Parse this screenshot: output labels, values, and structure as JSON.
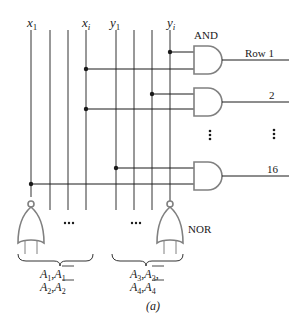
{
  "diagram": {
    "caption": "(a)",
    "column_labels": {
      "x1": "x",
      "x1_sub": "1",
      "xi": "x",
      "xi_sub": "i",
      "y1": "y",
      "y1_sub": "1",
      "yi": "y",
      "yi_sub": "i"
    },
    "gate_labels": {
      "and": "AND",
      "nor": "NOR"
    },
    "rows": [
      {
        "label": "Row 1"
      },
      {
        "label": "2"
      },
      {
        "label": "⋮"
      },
      {
        "label": "16"
      }
    ],
    "ellipsis_h": "•••",
    "ellipsis_v": "⋮",
    "left_group": {
      "line1_a": "A",
      "line1_a_sub": "1",
      "line1_sep": ",",
      "line1_b": "A",
      "line1_b_sub": "1",
      "line2_a": "A",
      "line2_a_sub": "2",
      "line2_sep": ",",
      "line2_b": "A",
      "line2_b_sub": "2"
    },
    "right_group": {
      "line1_a": "A",
      "line1_a_sub": "3",
      "line1_sep": ",",
      "line1_b": "A",
      "line1_b_sub": "3",
      "line1_end": ",",
      "line2_a": "A",
      "line2_a_sub": "4",
      "line2_sep": ",",
      "line2_b": "A",
      "line2_b_sub": "4"
    },
    "colors": {
      "line": "#1a1a1a",
      "gate_outline": "#808080"
    }
  }
}
